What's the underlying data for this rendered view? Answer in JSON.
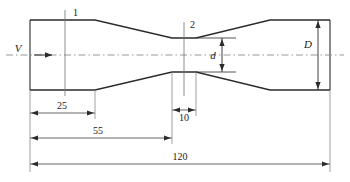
{
  "figure": {
    "stroke_color": "#2b2b2b",
    "thin_color": "#4a4a4a",
    "center_color": "#8a8a8a",
    "background": "#ffffff"
  },
  "labels": {
    "section_1": "1",
    "section_2": "2",
    "velocity": "V",
    "throat_diameter": "d",
    "pipe_diameter": "D"
  },
  "dimensions": {
    "inlet_length": "25",
    "throat_length": "10",
    "inlet_to_throat": "55",
    "overall_length": "120"
  },
  "geometry": {
    "pipe_top_y": 20,
    "pipe_bottom_y": 90,
    "throat_top_y": 38,
    "throat_bottom_y": 72,
    "centerline_y": 55,
    "x_left": 30,
    "x_cone_start": 95,
    "x_throat_start": 172,
    "x_throat_end": 196,
    "x_cone_end": 270,
    "x_right": 330
  }
}
